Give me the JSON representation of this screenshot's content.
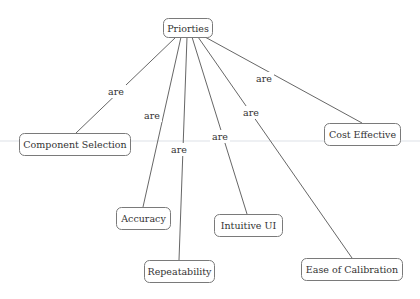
{
  "diagram": {
    "type": "concept-map",
    "root": {
      "id": "priorities",
      "label": "Priorties"
    },
    "nodes": [
      {
        "id": "component-selection",
        "label": "Component Selection"
      },
      {
        "id": "accuracy",
        "label": "Accuracy"
      },
      {
        "id": "repeatability",
        "label": "Repeatability"
      },
      {
        "id": "intuitive-ui",
        "label": "Intuitive UI"
      },
      {
        "id": "ease-of-calibration",
        "label": "Ease of Calibration"
      },
      {
        "id": "cost-effective",
        "label": "Cost Effective"
      }
    ],
    "edges": [
      {
        "from": "priorities",
        "to": "component-selection",
        "label": "are"
      },
      {
        "from": "priorities",
        "to": "accuracy",
        "label": "are"
      },
      {
        "from": "priorities",
        "to": "repeatability",
        "label": "are"
      },
      {
        "from": "priorities",
        "to": "intuitive-ui",
        "label": "are"
      },
      {
        "from": "priorities",
        "to": "ease-of-calibration",
        "label": "are"
      },
      {
        "from": "priorities",
        "to": "cost-effective",
        "label": "are"
      }
    ]
  }
}
